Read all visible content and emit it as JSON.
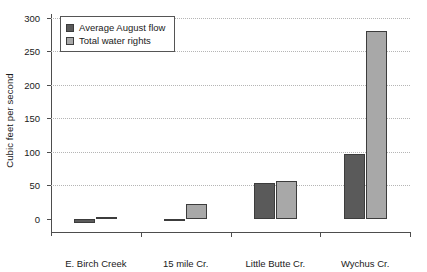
{
  "chart_data": {
    "type": "bar",
    "title": "",
    "xlabel": "",
    "ylabel": "Cubic feet per second",
    "categories": [
      "E. Birch Creek",
      "15 mile Cr.",
      "Little Butte Cr.",
      "Wychus Cr."
    ],
    "series": [
      {
        "name": "Average August flow",
        "color": "#5a5a5a",
        "values": [
          -6,
          -4,
          53,
          97
        ]
      },
      {
        "name": "Total water rights",
        "color": "#a8a8a8",
        "values": [
          3,
          22,
          57,
          280
        ]
      }
    ],
    "ylim": [
      -20,
      300
    ],
    "yticks": [
      0,
      50,
      100,
      150,
      200,
      250,
      300
    ],
    "ytick_labels": [
      "0",
      "50",
      "100",
      "150",
      "200",
      "250",
      "300"
    ],
    "grid": "horizontal-dotted",
    "legend_position": "top-left-inside"
  },
  "legend": {
    "items": [
      {
        "label": "Average August flow"
      },
      {
        "label": "Total water rights"
      }
    ]
  }
}
